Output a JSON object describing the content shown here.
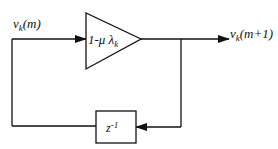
{
  "diagram": {
    "type": "feedback-loop block diagram",
    "input_label": {
      "main": "v",
      "sub": "k",
      "rest": "(m)"
    },
    "output_label": {
      "main": "v",
      "sub": "k",
      "rest": "(m+1)"
    },
    "gain_block": {
      "shape": "triangle",
      "label_prefix": "1-μ λ",
      "label_sub": "k"
    },
    "delay_block": {
      "shape": "rectangle",
      "label_main": "z",
      "label_sup": "-1"
    },
    "colors": {
      "stroke": "#111111",
      "background": "#ffffff"
    }
  }
}
